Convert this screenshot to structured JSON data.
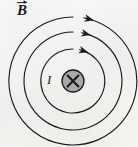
{
  "figure": {
    "background_color": "#f6f6f4",
    "line_color": "#1b1b1b",
    "labels": {
      "field_label": "B",
      "field_label_accent": "vector-arrow",
      "current_label": "I",
      "wire_direction_symbol": "×"
    },
    "wire": {
      "name": "current-into-page",
      "center_x": 73,
      "center_y": 81,
      "radius": 11,
      "fill_color": "#a9a9a9",
      "stroke_color": "#1b1b1b"
    },
    "field_lines": [
      {
        "name": "inner-field-line",
        "radius": 32,
        "arrow_angle_deg": -62
      },
      {
        "name": "middle-field-line",
        "radius": 49,
        "arrow_angle_deg": -70
      },
      {
        "name": "outer-field-line",
        "radius": 64,
        "arrow_angle_deg": -75
      }
    ],
    "arrow_direction": "clockwise"
  }
}
